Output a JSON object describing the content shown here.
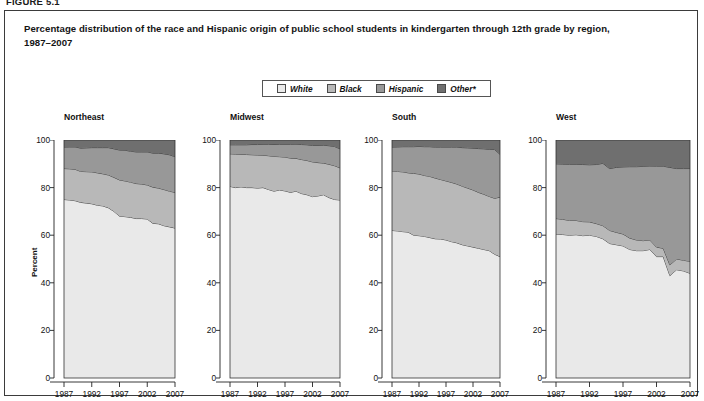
{
  "figure": {
    "number": "FIGURE 5.1",
    "title_line1": "Percentage distribution of the race and Hispanic origin of public school students in kindergarten through 12th grade by region,",
    "title_line2": "1987–2007"
  },
  "legend": {
    "position": "top-center",
    "items": [
      {
        "label": "White",
        "color": "#e9e9e9"
      },
      {
        "label": "Black",
        "color": "#b8b8b8"
      },
      {
        "label": "Hispanic",
        "color": "#989898"
      },
      {
        "label": "Other*",
        "color": "#6f6f6f"
      }
    ]
  },
  "axes": {
    "ylabel": "Percent",
    "yticks": [
      0,
      20,
      40,
      60,
      80,
      100
    ],
    "ylim": [
      0,
      100
    ],
    "xticks": [
      1987,
      1992,
      1997,
      2002,
      2007
    ],
    "xlim": [
      1987,
      2007
    ],
    "grid": false
  },
  "chart_data": {
    "type": "area",
    "title": "Percentage distribution of the race and Hispanic origin of public school students in kindergarten through 12th grade by region, 1987–2007",
    "xlabel": "",
    "ylabel": "Percent",
    "ylim": [
      0,
      100
    ],
    "xlim": [
      1987,
      2007
    ],
    "stacked": true,
    "x": [
      1987,
      1988,
      1989,
      1990,
      1991,
      1992,
      1993,
      1994,
      1995,
      1996,
      1997,
      1998,
      1999,
      2000,
      2001,
      2002,
      2003,
      2004,
      2005,
      2006,
      2007
    ],
    "panels": [
      {
        "name": "Northeast",
        "series": [
          {
            "name": "White",
            "color": "#e9e9e9",
            "values": [
              75.0,
              74.8,
              74.5,
              73.8,
              73.5,
              73.2,
              72.6,
              72.3,
              71.5,
              70.0,
              68.0,
              67.8,
              67.5,
              67.0,
              67.0,
              66.8,
              65.0,
              64.8,
              64.0,
              63.5,
              63.0
            ]
          },
          {
            "name": "Black",
            "color": "#b8b8b8",
            "values": [
              13.0,
              13.1,
              13.2,
              13.0,
              13.2,
              13.4,
              13.6,
              13.5,
              13.8,
              14.3,
              15.2,
              15.0,
              14.8,
              14.7,
              14.5,
              14.3,
              15.2,
              15.0,
              15.2,
              15.0,
              15.0
            ]
          },
          {
            "name": "Hispanic",
            "color": "#989898",
            "values": [
              9.0,
              9.2,
              9.4,
              9.8,
              10.0,
              10.2,
              10.6,
              11.0,
              11.5,
              12.0,
              12.6,
              12.9,
              13.0,
              13.3,
              13.5,
              13.9,
              14.3,
              14.7,
              15.0,
              15.3,
              15.0
            ]
          },
          {
            "name": "Other*",
            "color": "#6f6f6f",
            "values": [
              3.0,
              2.9,
              2.9,
              3.4,
              3.3,
              3.2,
              3.2,
              3.2,
              3.2,
              3.7,
              4.2,
              4.3,
              4.7,
              5.0,
              5.0,
              5.0,
              5.5,
              5.5,
              5.8,
              6.2,
              7.0
            ]
          }
        ],
        "boundaries_cumulative": {
          "white_top": [
            75,
            74.8,
            74.5,
            73.8,
            73.5,
            73.2,
            72.6,
            72.3,
            71.5,
            70,
            68,
            67.8,
            67.5,
            67,
            67,
            66.8,
            65,
            64.8,
            64,
            63.5,
            63
          ],
          "black_top": [
            88,
            87.9,
            87.7,
            86.8,
            86.7,
            86.6,
            86.2,
            85.8,
            85.3,
            84.3,
            83.2,
            82.8,
            82.3,
            81.7,
            81.5,
            81.1,
            80.2,
            79.8,
            79.2,
            78.5,
            78
          ],
          "hispanic_top": [
            97,
            97.1,
            97.1,
            96.6,
            96.7,
            96.8,
            96.8,
            96.8,
            96.8,
            96.3,
            95.8,
            95.7,
            95.3,
            95,
            95,
            95,
            94.5,
            94.5,
            94.2,
            93.8,
            93
          ]
        }
      },
      {
        "name": "Midwest",
        "series": [
          {
            "name": "White",
            "color": "#e9e9e9",
            "values": [
              80.5,
              80.0,
              80.3,
              80.0,
              80.0,
              79.8,
              80.0,
              79.2,
              78.5,
              79.0,
              78.6,
              78.0,
              78.5,
              77.5,
              77.0,
              76.2,
              76.5,
              77.0,
              75.8,
              75.0,
              74.8
            ]
          },
          {
            "name": "Black",
            "color": "#b8b8b8",
            "values": [
              13.7,
              14.1,
              13.7,
              13.9,
              13.8,
              13.9,
              13.6,
              14.2,
              14.6,
              14.0,
              14.2,
              14.4,
              13.8,
              14.3,
              14.4,
              14.6,
              14.0,
              13.3,
              14.0,
              14.2,
              13.5
            ]
          },
          {
            "name": "Hispanic",
            "color": "#989898",
            "values": [
              3.8,
              3.9,
              4.0,
              4.1,
              4.3,
              4.4,
              4.6,
              4.8,
              5.0,
              5.2,
              5.4,
              5.8,
              6.0,
              6.3,
              6.6,
              6.9,
              7.2,
              7.5,
              7.8,
              8.1,
              8.0
            ]
          },
          {
            "name": "Other*",
            "color": "#6f6f6f",
            "values": [
              2.0,
              2.0,
              2.0,
              2.0,
              1.9,
              1.9,
              1.8,
              1.8,
              1.9,
              1.8,
              1.8,
              1.8,
              1.7,
              1.9,
              2.0,
              2.3,
              2.3,
              2.2,
              2.4,
              2.7,
              3.7
            ]
          }
        ],
        "boundaries_cumulative": {
          "white_top": [
            80.5,
            80,
            80.3,
            80,
            80,
            79.8,
            80,
            79.2,
            78.5,
            79,
            78.6,
            78,
            78.5,
            77.5,
            77,
            76.2,
            76.5,
            77,
            75.8,
            75,
            74.8
          ],
          "black_top": [
            94.2,
            94.1,
            94,
            93.9,
            93.8,
            93.7,
            93.6,
            93.4,
            93.1,
            93,
            92.8,
            92.4,
            92.3,
            91.8,
            91.4,
            90.8,
            90.5,
            90.3,
            89.8,
            89.2,
            88.3
          ],
          "hispanic_top": [
            98,
            98,
            98,
            98,
            98.1,
            98.1,
            98.2,
            98.2,
            98.1,
            98.2,
            98.2,
            98.2,
            98.3,
            98.1,
            98,
            97.7,
            97.7,
            97.8,
            97.6,
            97.3,
            96.3
          ]
        }
      },
      {
        "name": "South",
        "series": [
          {
            "name": "White",
            "color": "#e9e9e9",
            "values": [
              62.0,
              61.8,
              61.5,
              61.3,
              60.0,
              59.8,
              59.5,
              59.0,
              58.5,
              58.4,
              58.0,
              57.3,
              56.8,
              56.0,
              55.5,
              55.0,
              54.5,
              54.0,
              53.5,
              52.0,
              51.0
            ]
          },
          {
            "name": "Black",
            "color": "#b8b8b8",
            "values": [
              25.0,
              25.0,
              25.1,
              24.9,
              26.0,
              25.9,
              25.6,
              25.7,
              25.5,
              25.0,
              24.8,
              24.9,
              24.7,
              24.6,
              24.3,
              24.0,
              23.5,
              23.2,
              22.8,
              23.5,
              25.0
            ]
          },
          {
            "name": "Hispanic",
            "color": "#989898",
            "values": [
              10.0,
              10.3,
              10.6,
              11.0,
              11.2,
              11.6,
              12.1,
              12.5,
              13.0,
              13.6,
              14.2,
              14.8,
              15.5,
              16.2,
              16.9,
              17.6,
              18.4,
              19.1,
              19.8,
              20.5,
              18.0
            ]
          },
          {
            "name": "Other*",
            "color": "#6f6f6f",
            "values": [
              3.0,
              2.9,
              2.8,
              2.8,
              2.8,
              2.7,
              2.8,
              2.8,
              3.0,
              3.0,
              3.0,
              3.0,
              3.0,
              3.2,
              3.3,
              3.4,
              3.6,
              3.7,
              3.9,
              4.0,
              6.0
            ]
          }
        ],
        "boundaries_cumulative": {
          "white_top": [
            62,
            61.8,
            61.5,
            61.3,
            60,
            59.8,
            59.5,
            59,
            58.5,
            58.4,
            58,
            57.3,
            56.8,
            56,
            55.5,
            55,
            54.5,
            54,
            53.5,
            52,
            51
          ],
          "black_top": [
            87,
            86.8,
            86.6,
            86.2,
            86,
            85.7,
            85.1,
            84.7,
            84,
            83.4,
            82.8,
            82.2,
            81.5,
            80.6,
            79.8,
            79,
            78,
            77.2,
            76.3,
            75.5,
            76
          ],
          "hispanic_top": [
            97,
            97.1,
            97.2,
            97.2,
            97.2,
            97.3,
            97.2,
            97.2,
            97,
            97,
            97,
            97,
            97,
            96.8,
            96.7,
            96.6,
            96.4,
            96.3,
            96.1,
            96,
            94
          ]
        }
      },
      {
        "name": "West",
        "series": [
          {
            "name": "White",
            "color": "#e9e9e9",
            "values": [
              60.5,
              60.3,
              60.0,
              60.2,
              59.8,
              60.0,
              59.5,
              58.5,
              56.5,
              56.0,
              55.5,
              54.0,
              53.5,
              53.5,
              54.0,
              51.0,
              51.0,
              43.0,
              45.5,
              45.0,
              44.0
            ]
          },
          {
            "name": "Black",
            "color": "#b8b8b8",
            "values": [
              6.5,
              6.4,
              6.2,
              6.0,
              5.9,
              5.6,
              5.4,
              5.5,
              5.5,
              5.2,
              5.0,
              4.8,
              4.5,
              4.2,
              4.0,
              4.0,
              3.5,
              4.5,
              4.5,
              4.5,
              5.0
            ]
          },
          {
            "name": "Hispanic",
            "color": "#989898",
            "values": [
              23.0,
              23.2,
              23.6,
              23.6,
              24.0,
              24.0,
              24.8,
              26.2,
              26.0,
              27.3,
              28.2,
              30.0,
              30.8,
              31.2,
              31.1,
              34.0,
              34.5,
              41.0,
              38.0,
              38.5,
              39.0
            ]
          },
          {
            "name": "Other*",
            "color": "#6f6f6f",
            "values": [
              10.0,
              10.1,
              10.2,
              10.2,
              10.3,
              10.4,
              10.3,
              9.8,
              12.0,
              11.5,
              11.3,
              11.2,
              11.2,
              11.1,
              10.9,
              11.0,
              11.0,
              11.5,
              12.0,
              12.0,
              12.0
            ]
          }
        ],
        "boundaries_cumulative": {
          "white_top": [
            60.5,
            60.3,
            60,
            60.2,
            59.8,
            60,
            59.5,
            58.5,
            56.5,
            56,
            55.5,
            54,
            53.5,
            53.5,
            54,
            51,
            51,
            43,
            45.5,
            45,
            44
          ],
          "black_top": [
            67,
            66.7,
            66.2,
            66.2,
            65.7,
            65.6,
            64.9,
            64,
            62,
            61.2,
            60.5,
            58.8,
            58,
            57.7,
            58,
            55,
            54.5,
            47.5,
            50,
            49.5,
            49
          ],
          "hispanic_top": [
            90,
            89.9,
            89.8,
            89.8,
            89.7,
            89.6,
            89.7,
            90.2,
            88,
            88.5,
            88.7,
            88.8,
            88.8,
            88.8,
            89.1,
            89,
            89,
            88.5,
            88,
            88,
            88
          ]
        }
      }
    ]
  }
}
